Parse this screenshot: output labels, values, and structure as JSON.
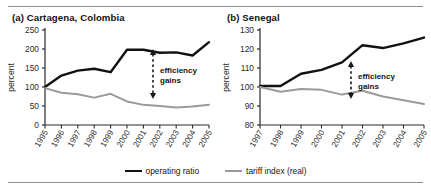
{
  "figure": {
    "legend": [
      {
        "label": "operating ratio",
        "color": "#111111",
        "key": "operating_ratio"
      },
      {
        "label": "tariff index (real)",
        "color": "#9a9a9a",
        "key": "tariff_index"
      }
    ]
  },
  "chart_data": [
    {
      "type": "line",
      "panel": "a",
      "title": "(a)  Cartagena, Colombia",
      "xlabel": "",
      "ylabel": "percent",
      "x": [
        "1995",
        "1996",
        "1997",
        "1998",
        "1999",
        "2000",
        "2001",
        "2002",
        "2003",
        "2004",
        "2005"
      ],
      "ylim": [
        0,
        250
      ],
      "yticks": [
        0,
        50,
        100,
        150,
        200,
        250
      ],
      "grid": false,
      "legend_position": "bottom",
      "annotation": {
        "text": "efficiency gains",
        "line1": "efficiency",
        "line2": "gains",
        "arrow": "double-vertical"
      },
      "series": [
        {
          "name": "operating ratio",
          "color": "#111111",
          "values": [
            100,
            130,
            143,
            148,
            139,
            198,
            198,
            190,
            191,
            183,
            218,
            220
          ]
        },
        {
          "name": "tariff index (real)",
          "color": "#9a9a9a",
          "values": [
            97,
            85,
            81,
            72,
            82,
            62,
            53,
            50,
            46,
            49,
            53,
            53
          ]
        }
      ]
    },
    {
      "type": "line",
      "panel": "b",
      "title": "(b)  Senegal",
      "xlabel": "",
      "ylabel": "percent",
      "x": [
        "1997",
        "1998",
        "1999",
        "2000",
        "2001",
        "2002",
        "2003",
        "2004",
        "2005"
      ],
      "ylim": [
        80,
        130
      ],
      "yticks": [
        80,
        90,
        100,
        110,
        120,
        130
      ],
      "grid": false,
      "legend_position": "bottom",
      "annotation": {
        "text": "efficiency gains",
        "line1": "efficiency",
        "line2": "gains",
        "arrow": "double-vertical"
      },
      "series": [
        {
          "name": "operating ratio",
          "color": "#111111",
          "values": [
            100.5,
            100.5,
            107,
            109,
            113,
            122,
            120.5,
            123,
            126
          ]
        },
        {
          "name": "tariff index (real)",
          "color": "#9a9a9a",
          "values": [
            100,
            97.5,
            99,
            98.5,
            96,
            98,
            95,
            93,
            91
          ]
        }
      ]
    }
  ]
}
